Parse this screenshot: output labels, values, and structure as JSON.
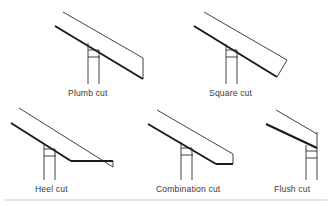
{
  "figure": {
    "background_color": "#ffffff",
    "line_color": "#1a1a1a",
    "thin_line_color": "#2b2b2b",
    "label_color": "#3a3a3a",
    "rule_color": "#c9c9c9",
    "diagrams": [
      {
        "id": "plumb-cut",
        "label": "Plumb cut",
        "description": "Rafter with a vertical plumb cut at the tail end"
      },
      {
        "id": "square-cut",
        "label": "Square cut",
        "description": "Rafter with the tail cut perpendicular to the rafter run"
      },
      {
        "id": "heel-cut",
        "label": "Heel cut",
        "description": "Rafter with a level heel cut tapering to a point"
      },
      {
        "id": "combination-cut",
        "label": "Combination cut",
        "description": "Rafter with a combined level seat cut and vertical plumb cut"
      },
      {
        "id": "flush-cut",
        "label": "Flush cut",
        "description": "Rafter ending flush with the vertical wall face"
      }
    ]
  }
}
